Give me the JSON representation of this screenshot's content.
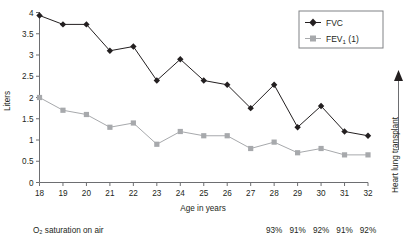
{
  "chart_data": {
    "type": "line",
    "title": "",
    "xlabel": "Age in years",
    "ylabel": "Liters",
    "x": [
      18,
      19,
      20,
      21,
      22,
      23,
      24,
      25,
      26,
      27,
      28,
      29,
      30,
      31,
      32
    ],
    "xticklabels": [
      "18",
      "19",
      "20",
      "21",
      "22",
      "23",
      "24",
      "25",
      "26",
      "27",
      "28",
      "29",
      "30",
      "31",
      "32"
    ],
    "yticklabels": [
      "0",
      "0.5",
      "1",
      "1.5",
      "2",
      "2.5",
      "3",
      "3.5",
      "4"
    ],
    "yticks": [
      0,
      0.5,
      1,
      1.5,
      2,
      2.5,
      3,
      3.5,
      4
    ],
    "ylim": [
      0,
      4
    ],
    "xlim": [
      18,
      32
    ],
    "grid": false,
    "legend_position": "top-right",
    "series": [
      {
        "name": "FVC",
        "color": "#231f20",
        "marker": "diamond",
        "values": [
          3.93,
          3.72,
          3.72,
          3.1,
          3.2,
          2.4,
          2.9,
          2.4,
          2.3,
          1.75,
          2.3,
          1.3,
          1.8,
          1.2,
          1.1
        ]
      },
      {
        "name": "FEV1 (1)",
        "color": "#a7a9ac",
        "marker": "square",
        "values": [
          2.0,
          1.7,
          1.6,
          1.3,
          1.4,
          0.9,
          1.2,
          1.1,
          1.1,
          0.8,
          0.95,
          0.7,
          0.8,
          0.65,
          0.65
        ]
      }
    ],
    "annotations": {
      "o2_label": "O₂ saturation on air",
      "o2_values": [
        "",
        "",
        "",
        "",
        "",
        "93%",
        "91%",
        "92%",
        "91%",
        "92%",
        "90%",
        "89%",
        "89%",
        "77%"
      ],
      "o2_start_age": 23,
      "right_axis_label": "Heart lung transplant"
    }
  },
  "legend": {
    "items": [
      {
        "label": "FVC",
        "sub": "",
        "tail": ""
      },
      {
        "label": "FEV",
        "sub": "1",
        "tail": " (1)"
      }
    ]
  }
}
